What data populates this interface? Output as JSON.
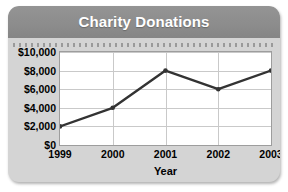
{
  "card": {
    "background_color": "#d4d4d4",
    "header_color": "#8c8c8c"
  },
  "header": {
    "title": "Charity Donations"
  },
  "chart_data": {
    "type": "line",
    "title": "Charity Donations",
    "xlabel": "Year",
    "ylabel": "",
    "categories": [
      "1999",
      "2000",
      "2001",
      "2002",
      "2003"
    ],
    "values": [
      2000,
      4000,
      8000,
      6000,
      8000
    ],
    "x": [
      1999,
      2000,
      2001,
      2002,
      2003
    ],
    "ylim": [
      0,
      10000
    ],
    "ytick_values": [
      0,
      2000,
      4000,
      6000,
      8000,
      10000
    ],
    "ytick_labels": [
      "$0",
      "$2,000",
      "$4,000",
      "$6,000",
      "$8,000",
      "$10,000"
    ],
    "xtick_labels": [
      "1999",
      "2000",
      "2001",
      "2002",
      "2003"
    ],
    "grid": true,
    "legend": false,
    "series": [
      {
        "name": "Donations",
        "values": [
          2000,
          4000,
          8000,
          6000,
          8000
        ],
        "color": "#333333",
        "marker": "circle"
      }
    ],
    "line_color": "#333333",
    "plot_background": "#ffffff",
    "gridline_color": "#c9c9c9"
  }
}
